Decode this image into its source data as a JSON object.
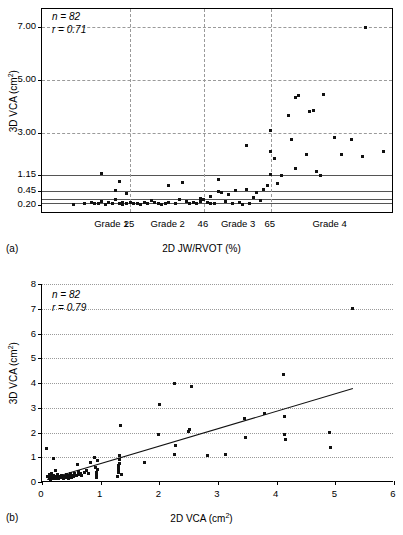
{
  "figure": {
    "panel_a_label": "(a)",
    "panel_b_label": "(b)"
  },
  "chart_data": [
    {
      "id": "panel-a",
      "type": "scatter",
      "title": "",
      "panel": "(a)",
      "xlabel": "2D JW/RVOT (%)",
      "ylabel": "3D VCA (cm²)",
      "annotations": [
        "n = 82",
        "r = 0.71"
      ],
      "stats": {
        "n": 82,
        "r": 0.71
      },
      "n_label": "n = 82",
      "r_label": "r = 0.71",
      "grid": "dashed-both",
      "legend": "none",
      "xlim": [
        0,
        100
      ],
      "ylim_display": [
        0.2,
        7.8
      ],
      "y_tick_labels": [
        "7.00",
        "5.00",
        "3.00",
        "1.15",
        "0.45",
        "0.20"
      ],
      "y_tick_values": [
        7.0,
        5.0,
        3.0,
        1.15,
        0.45,
        0.2
      ],
      "y_scale_note": "non-linear/broken axis; ticks unevenly spaced",
      "x_category_labels": [
        "Grade 1",
        "25",
        "Grade 2",
        "46",
        "Grade 3",
        "65",
        "Grade 4"
      ],
      "x_boundary_values": [
        25,
        46,
        65
      ],
      "reference_lines_y": [
        1.15,
        0.45,
        0.3,
        0.24
      ],
      "points": [
        [
          9,
          0.21
        ],
        [
          12,
          0.22
        ],
        [
          14,
          0.25
        ],
        [
          15,
          0.22
        ],
        [
          16,
          0.23
        ],
        [
          17,
          0.26
        ],
        [
          17,
          1.23
        ],
        [
          18,
          0.21
        ],
        [
          19,
          0.24
        ],
        [
          20,
          0.22
        ],
        [
          21,
          0.3
        ],
        [
          21,
          0.47
        ],
        [
          22,
          0.23
        ],
        [
          22,
          0.86
        ],
        [
          23,
          0.25
        ],
        [
          23,
          0.21
        ],
        [
          24,
          0.4
        ],
        [
          24,
          0.22
        ],
        [
          25,
          0.24
        ],
        [
          26,
          0.22
        ],
        [
          27,
          0.23
        ],
        [
          28,
          0.21
        ],
        [
          29,
          0.25
        ],
        [
          30,
          0.22
        ],
        [
          31,
          0.28
        ],
        [
          32,
          0.24
        ],
        [
          33,
          0.22
        ],
        [
          34,
          0.21
        ],
        [
          35,
          0.23
        ],
        [
          36,
          0.25
        ],
        [
          36,
          0.68
        ],
        [
          38,
          0.23
        ],
        [
          39,
          0.3
        ],
        [
          40,
          0.83
        ],
        [
          41,
          0.26
        ],
        [
          42,
          0.22
        ],
        [
          43,
          0.24
        ],
        [
          44,
          0.23
        ],
        [
          45,
          0.32
        ],
        [
          45,
          0.26
        ],
        [
          46,
          0.29
        ],
        [
          47,
          0.24
        ],
        [
          48,
          0.22
        ],
        [
          48,
          0.36
        ],
        [
          49,
          0.23
        ],
        [
          50,
          0.45
        ],
        [
          50,
          0.95
        ],
        [
          51,
          0.42
        ],
        [
          52,
          0.26
        ],
        [
          53,
          0.38
        ],
        [
          54,
          0.22
        ],
        [
          55,
          0.47
        ],
        [
          56,
          0.24
        ],
        [
          57,
          0.21
        ],
        [
          58,
          2.45
        ],
        [
          58,
          0.53
        ],
        [
          59,
          0.22
        ],
        [
          60,
          0.34
        ],
        [
          61,
          0.43
        ],
        [
          62,
          0.28
        ],
        [
          63,
          0.5
        ],
        [
          64,
          0.68
        ],
        [
          65,
          1.17
        ],
        [
          65,
          2.2
        ],
        [
          65,
          3.1
        ],
        [
          66,
          1.86
        ],
        [
          67,
          0.78
        ],
        [
          68,
          1.15
        ],
        [
          70,
          3.65
        ],
        [
          71,
          2.72
        ],
        [
          72,
          1.45
        ],
        [
          72,
          4.35
        ],
        [
          73,
          4.42
        ],
        [
          75,
          2.05
        ],
        [
          76,
          3.8
        ],
        [
          77,
          3.85
        ],
        [
          78,
          1.3
        ],
        [
          79,
          1.14
        ],
        [
          80,
          4.45
        ],
        [
          83,
          2.78
        ],
        [
          85,
          2.05
        ],
        [
          88,
          2.72
        ],
        [
          91,
          1.95
        ],
        [
          97,
          2.2
        ],
        [
          92,
          7.0
        ]
      ]
    },
    {
      "id": "panel-b",
      "type": "scatter",
      "title": "",
      "panel": "(b)",
      "xlabel": "2D VCA (cm²)",
      "ylabel": "3D VCA (cm²)",
      "annotations": [
        "n = 82",
        "r = 0.79"
      ],
      "stats": {
        "n": 82,
        "r": 0.79
      },
      "n_label": "n = 82",
      "r_label": "r = 0.79",
      "grid": "horizontal-dotted",
      "legend": "none",
      "xlim": [
        0,
        6
      ],
      "ylim": [
        0,
        8
      ],
      "x_tick_labels": [
        "0",
        "1",
        "2",
        "3",
        "4",
        "5",
        "6"
      ],
      "x_tick_values": [
        0,
        1,
        2,
        3,
        4,
        5,
        6
      ],
      "y_tick_labels": [
        "0",
        "1",
        "2",
        "3",
        "4",
        "5",
        "6",
        "7",
        "8"
      ],
      "y_tick_values": [
        0,
        1,
        2,
        3,
        4,
        5,
        6,
        7,
        8
      ],
      "trendline": {
        "x0": 0.08,
        "y0": 0.12,
        "x1": 5.3,
        "y1": 3.8
      },
      "points": [
        [
          0.07,
          1.37
        ],
        [
          0.1,
          0.22
        ],
        [
          0.12,
          0.16
        ],
        [
          0.13,
          0.3
        ],
        [
          0.14,
          0.12
        ],
        [
          0.15,
          0.25
        ],
        [
          0.16,
          0.18
        ],
        [
          0.17,
          0.35
        ],
        [
          0.18,
          0.14
        ],
        [
          0.19,
          0.22
        ],
        [
          0.2,
          0.93
        ],
        [
          0.2,
          0.28
        ],
        [
          0.21,
          0.16
        ],
        [
          0.22,
          0.2
        ],
        [
          0.23,
          0.45
        ],
        [
          0.24,
          0.13
        ],
        [
          0.25,
          0.24
        ],
        [
          0.26,
          0.18
        ],
        [
          0.27,
          0.32
        ],
        [
          0.28,
          0.15
        ],
        [
          0.3,
          0.22
        ],
        [
          0.31,
          0.17
        ],
        [
          0.33,
          0.27
        ],
        [
          0.34,
          0.2
        ],
        [
          0.36,
          0.14
        ],
        [
          0.38,
          0.24
        ],
        [
          0.4,
          0.19
        ],
        [
          0.42,
          0.3
        ],
        [
          0.44,
          0.22
        ],
        [
          0.45,
          0.16
        ],
        [
          0.47,
          0.26
        ],
        [
          0.48,
          0.35
        ],
        [
          0.5,
          0.2
        ],
        [
          0.52,
          0.28
        ],
        [
          0.54,
          0.24
        ],
        [
          0.56,
          0.33
        ],
        [
          0.58,
          0.26
        ],
        [
          0.6,
          0.72
        ],
        [
          0.62,
          0.3
        ],
        [
          0.63,
          0.42
        ],
        [
          0.65,
          0.36
        ],
        [
          0.68,
          0.28
        ],
        [
          0.72,
          0.4
        ],
        [
          0.76,
          0.46
        ],
        [
          0.8,
          0.34
        ],
        [
          0.82,
          0.79
        ],
        [
          0.9,
          0.97
        ],
        [
          0.92,
          0.6
        ],
        [
          0.93,
          0.4
        ],
        [
          0.93,
          0.25
        ],
        [
          0.93,
          0.18
        ],
        [
          0.94,
          0.52
        ],
        [
          0.95,
          0.87
        ],
        [
          1.28,
          0.22
        ],
        [
          1.3,
          0.38
        ],
        [
          1.3,
          0.48
        ],
        [
          1.31,
          0.57
        ],
        [
          1.31,
          0.66
        ],
        [
          1.32,
          0.74
        ],
        [
          1.32,
          0.9
        ],
        [
          1.32,
          1.08
        ],
        [
          1.33,
          2.28
        ],
        [
          1.35,
          0.3
        ],
        [
          1.75,
          0.8
        ],
        [
          1.98,
          1.93
        ],
        [
          2.0,
          3.15
        ],
        [
          2.25,
          1.12
        ],
        [
          2.26,
          4.0
        ],
        [
          2.28,
          1.47
        ],
        [
          2.5,
          2.06
        ],
        [
          2.52,
          2.12
        ],
        [
          2.54,
          3.86
        ],
        [
          2.82,
          1.06
        ],
        [
          3.13,
          1.13
        ],
        [
          3.45,
          2.58
        ],
        [
          3.47,
          1.81
        ],
        [
          3.8,
          2.76
        ],
        [
          4.12,
          4.36
        ],
        [
          4.13,
          2.66
        ],
        [
          4.14,
          1.92
        ],
        [
          4.15,
          1.7
        ],
        [
          4.9,
          2.0
        ],
        [
          4.92,
          1.38
        ],
        [
          5.3,
          7.03
        ]
      ]
    }
  ]
}
